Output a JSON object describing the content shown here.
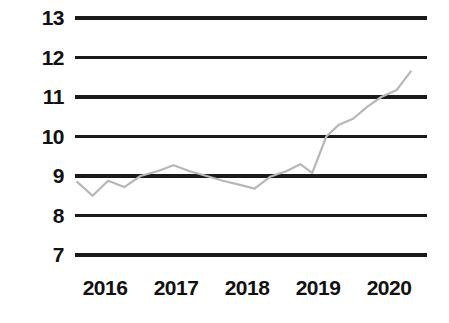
{
  "chart_data": {
    "type": "line",
    "title": "",
    "subtitle": "",
    "xlabel": "",
    "ylabel": "",
    "grid": true,
    "grid_axis": "y",
    "legend": false,
    "legend_position": "none",
    "line_color": "#b7b7b7",
    "gridline_color": "#1a1a1a",
    "background_color": "#ffffff",
    "text_color": "#111111",
    "ylim": [
      7,
      13
    ],
    "yticks": [
      7,
      8,
      9,
      10,
      11,
      12,
      13
    ],
    "ytick_labels": [
      "7",
      "8",
      "9",
      "10",
      "11",
      "12",
      "13"
    ],
    "xlim": [
      2015.75,
      2020.75
    ],
    "xticks": [
      2016,
      2017,
      2018,
      2019,
      2020
    ],
    "xtick_labels": [
      "2016",
      "2017",
      "2018",
      "2019",
      "2020"
    ],
    "series": [
      {
        "name": "value",
        "x": [
          2015.78,
          2016.0,
          2016.22,
          2016.45,
          2016.68,
          2016.92,
          2017.15,
          2017.38,
          2017.62,
          2017.85,
          2018.08,
          2018.3,
          2018.52,
          2018.75,
          2018.95,
          2019.12,
          2019.32,
          2019.5,
          2019.7,
          2019.9,
          2020.1,
          2020.32,
          2020.52
        ],
        "values": [
          8.85,
          8.5,
          8.88,
          8.72,
          9.0,
          9.12,
          9.27,
          9.12,
          9.0,
          8.88,
          8.78,
          8.68,
          8.98,
          9.12,
          9.3,
          9.08,
          10.0,
          10.3,
          10.45,
          10.75,
          11.0,
          11.18,
          11.65
        ]
      }
    ]
  },
  "geometry": {
    "plot_left": 75,
    "plot_right": 427,
    "plot_top": 18,
    "plot_bottom": 255,
    "x_label_y": 276,
    "x_label_positions": [
      105,
      176,
      247,
      318,
      389
    ],
    "y_label_right_offsets": [
      398,
      398,
      398,
      398,
      398,
      398,
      398
    ]
  }
}
